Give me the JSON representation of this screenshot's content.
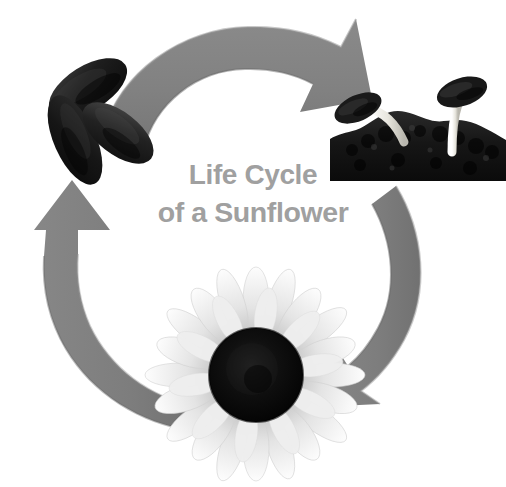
{
  "poster": {
    "title_line_1": "Life Cycle",
    "title_line_2": "of a Sunflower",
    "background_color": "#ffffff",
    "title_color": "#a0a0a0",
    "arrow_color": "#808080",
    "arrow_shadow_color": "#6e6e6e",
    "palette": {
      "seed_dark": "#1b1b1b",
      "seed_highlight": "#4a4a4a",
      "soil_dark": "#151515",
      "sprout_stem": "#f0efe9",
      "flower_disc": "#0d0d0d",
      "flower_petal": "#e9e9e9",
      "flower_petal_shade": "#c9c9c9"
    }
  },
  "stages": [
    {
      "id": "seeds",
      "label": "Sunflower seeds",
      "position": "top-left",
      "description": "Cluster of three dark sunflower seeds"
    },
    {
      "id": "germination",
      "label": "Germinating seedlings in soil",
      "position": "top-right",
      "description": "Two sprouts with pale stems emerging from dark soil, seed husks still attached"
    },
    {
      "id": "bloom",
      "label": "Blooming sunflower",
      "position": "bottom-center",
      "description": "Mature sunflower head with dark center disc and light petals"
    }
  ],
  "arrows": [
    {
      "id": "arrow-top",
      "label": "Seeds to germination",
      "from": "seeds",
      "to": "germination",
      "direction": "clockwise, points down-right"
    },
    {
      "id": "arrow-right",
      "label": "Germination to bloom",
      "from": "germination",
      "to": "bloom",
      "direction": "clockwise, points down-left"
    },
    {
      "id": "arrow-left",
      "label": "Bloom back to seeds",
      "from": "bloom",
      "to": "seeds",
      "direction": "clockwise, points up"
    }
  ]
}
